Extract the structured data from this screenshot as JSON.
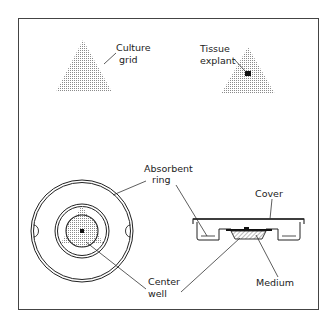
{
  "figure": {
    "labels": {
      "culture_grid": [
        "Culture",
        "grid"
      ],
      "tissue_explant": [
        "Tissue",
        "explant"
      ],
      "absorbent_ring": [
        "Absorbent",
        "ring"
      ],
      "cover": "Cover",
      "center_well": [
        "Center",
        "well"
      ],
      "medium": "Medium"
    },
    "colors": {
      "line": "#222222",
      "stipple": "#9a9a9a",
      "background": "#ffffff"
    }
  }
}
